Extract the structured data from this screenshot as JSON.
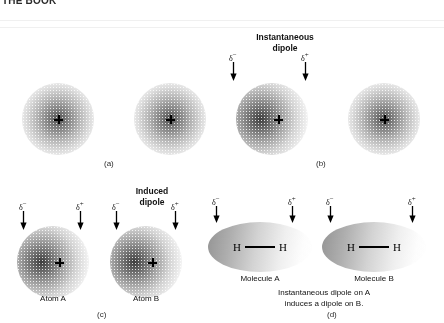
{
  "figure": {
    "top_fragment": "THE BOOK",
    "panels": [
      {
        "id": "a",
        "letter": "(a)"
      },
      {
        "id": "b",
        "letter": "(b)"
      },
      {
        "id": "c",
        "letter": "(c)"
      },
      {
        "id": "d",
        "letter": "(d)"
      }
    ]
  },
  "headings": {
    "instantaneous_dipole_line1": "Instantaneous",
    "instantaneous_dipole_line2": "dipole",
    "induced_dipole_line1": "Induced",
    "induced_dipole_line2": "dipole"
  },
  "charges": {
    "negative": "δ",
    "negative_sign": "−",
    "positive": "δ",
    "positive_sign": "+"
  },
  "labels": {
    "atom_a": "Atom A",
    "atom_b": "Atom B",
    "molecule_a": "Molecule A",
    "molecule_b": "Molecule B",
    "hydrogen": "H"
  },
  "caption": {
    "line1": "Instantaneous dipole on A",
    "line2": "induces a dipole on B."
  },
  "colors": {
    "cloud_dark": "#232323",
    "cloud_light": "#b4b4b4",
    "molecule_fill": "#8c8c8c",
    "text": "#111111",
    "background": "#ffffff"
  }
}
